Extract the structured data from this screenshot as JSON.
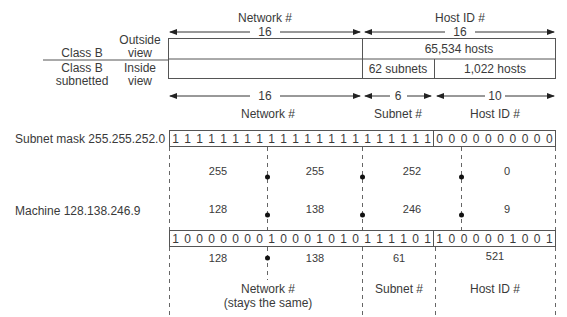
{
  "top": {
    "network_label": "Network #",
    "network_bits": "16",
    "host_label": "Host ID #",
    "host_bits": "16",
    "row_labels": [
      {
        "class": "Class B",
        "view": [
          "Outside",
          "view"
        ]
      },
      {
        "class": [
          "Class B",
          "subnetted"
        ],
        "view": [
          "Inside",
          "view"
        ]
      }
    ],
    "outside_host_cell": "65,534 hosts",
    "inside_subnet_cell": "62 subnets",
    "inside_host_cell": "1,022 hosts"
  },
  "split": {
    "network_bits": "16",
    "subnet_bits": "6",
    "host_bits": "10",
    "network_label": "Network #",
    "subnet_label": "Subnet #",
    "host_label": "Host ID #"
  },
  "mask": {
    "label": "Subnet mask 255.255.252.0",
    "bits_left": "1111111111111111111111",
    "bits_right": "0000000000",
    "octets": [
      "255",
      "255",
      "252",
      "0"
    ]
  },
  "machine": {
    "label": "Machine 128.138.246.9",
    "octets": [
      "128",
      "138",
      "246",
      "9"
    ],
    "bits_left": "1000000010001010111101",
    "bits_right": "1000001001"
  },
  "result": {
    "network_values": [
      "128",
      "138"
    ],
    "subnet_value": "61",
    "host_value": "521",
    "network_label": "Network #",
    "network_note": "(stays the same)",
    "subnet_label": "Subnet #",
    "host_label": "Host ID #"
  }
}
